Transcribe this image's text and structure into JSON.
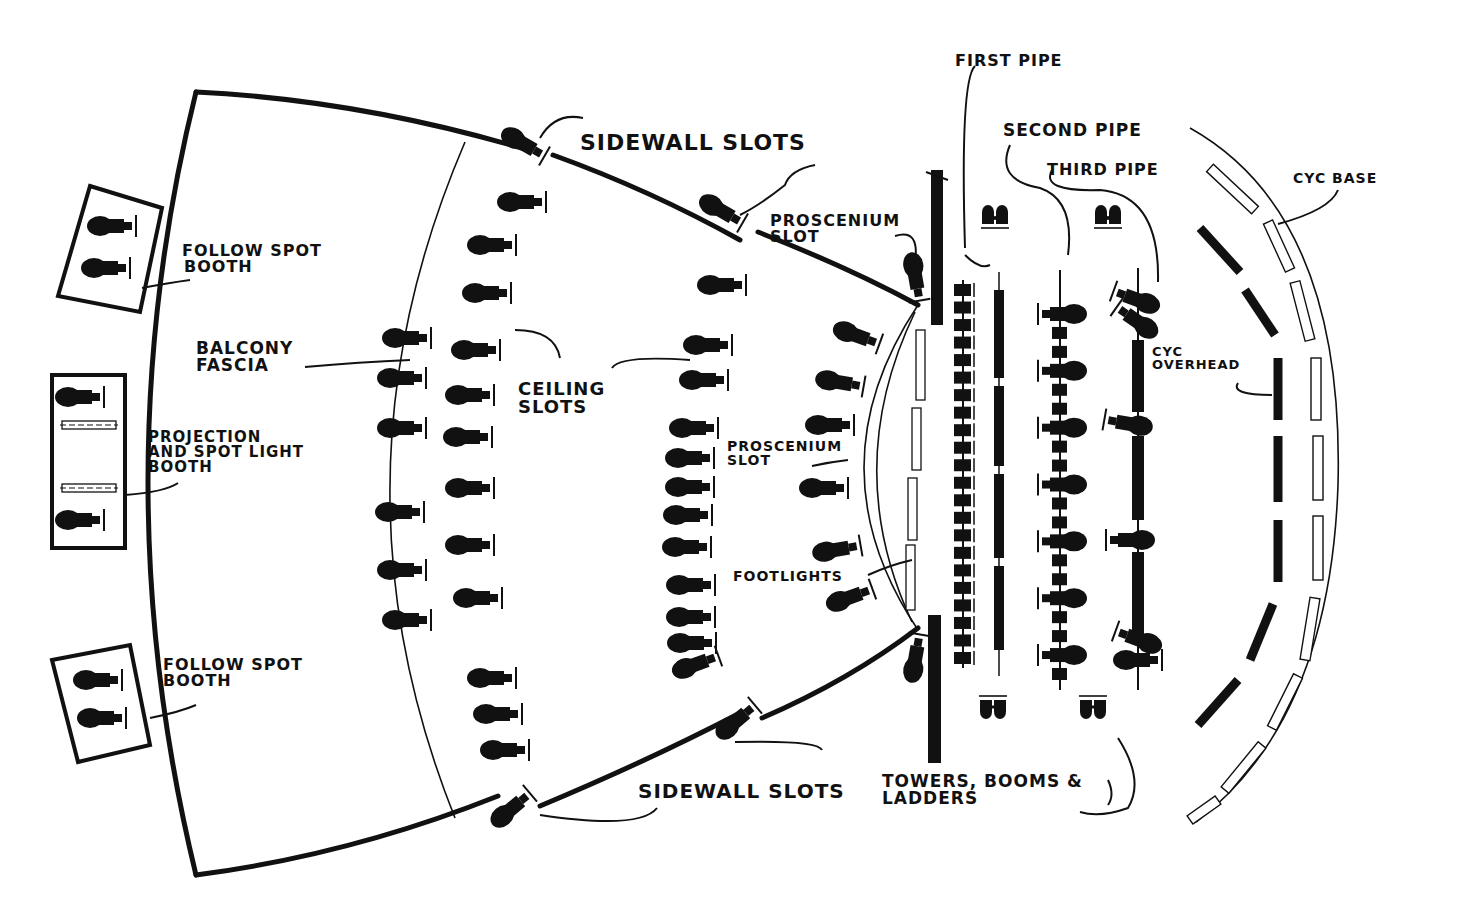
{
  "diagram": {
    "colors": {
      "ink": "#111111",
      "paper": "#ffffff"
    },
    "labels": [
      {
        "id": "first-pipe",
        "lines": [
          "FIRST PIPE"
        ],
        "x": 955,
        "y": 66,
        "size": 16
      },
      {
        "id": "second-pipe",
        "lines": [
          "SECOND PIPE"
        ],
        "x": 1003,
        "y": 136,
        "size": 17
      },
      {
        "id": "third-pipe",
        "lines": [
          "THIRD PIPE"
        ],
        "x": 1047,
        "y": 175,
        "size": 16
      },
      {
        "id": "cyc-base",
        "lines": [
          "CYC BASE"
        ],
        "x": 1293,
        "y": 183,
        "size": 14
      },
      {
        "id": "sidewall-slots-top",
        "lines": [
          "SIDEWALL SLOTS"
        ],
        "x": 580,
        "y": 150,
        "size": 22
      },
      {
        "id": "proscenium-slot-top",
        "lines": [
          "PROSCENIUM",
          "SLOT"
        ],
        "x": 770,
        "y": 226,
        "size": 16
      },
      {
        "id": "follow-spot-booth-top",
        "lines": [
          "FOLLOW SPOT",
          "BOOTH"
        ],
        "x": 182,
        "y": 256,
        "size": 16
      },
      {
        "id": "balcony-fascia",
        "lines": [
          "BALCONY",
          "FASCIA"
        ],
        "x": 196,
        "y": 354,
        "size": 17
      },
      {
        "id": "ceiling-slots",
        "lines": [
          "CEILING",
          "SLOTS"
        ],
        "x": 518,
        "y": 395,
        "size": 18
      },
      {
        "id": "cyc-overhead",
        "lines": [
          "CYC",
          "OVERHEAD"
        ],
        "x": 1152,
        "y": 356,
        "size": 13
      },
      {
        "id": "projection-booth",
        "lines": [
          "PROJECTION",
          "AND SPOT LIGHT",
          "BOOTH"
        ],
        "x": 148,
        "y": 442,
        "size": 15
      },
      {
        "id": "proscenium-slot-mid",
        "lines": [
          "PROSCENIUM",
          "SLOT"
        ],
        "x": 727,
        "y": 451,
        "size": 14
      },
      {
        "id": "footlights",
        "lines": [
          "FOOTLIGHTS"
        ],
        "x": 733,
        "y": 581,
        "size": 14
      },
      {
        "id": "follow-spot-booth-bottom",
        "lines": [
          "FOLLOW SPOT",
          "BOOTH"
        ],
        "x": 163,
        "y": 670,
        "size": 16
      },
      {
        "id": "sidewall-slots-bottom",
        "lines": [
          "SIDEWALL SLOTS"
        ],
        "x": 638,
        "y": 798,
        "size": 20
      },
      {
        "id": "towers-booms-ladders",
        "lines": [
          "TOWERS, BOOMS &",
          "LADDERS"
        ],
        "x": 882,
        "y": 787,
        "size": 17
      }
    ],
    "booths": [
      {
        "id": "follow-spot-booth-top",
        "points": "90,186 162,208 140,312 58,296",
        "fixtures": [
          [
            110,
            226,
            0
          ],
          [
            104,
            268,
            0
          ]
        ]
      },
      {
        "id": "projection-booth",
        "points": "52,375 125,375 125,548 52,548",
        "fixtures": [
          [
            78,
            397,
            0
          ],
          [
            78,
            520,
            0
          ]
        ]
      },
      {
        "id": "follow-spot-booth-bottom",
        "points": "52,660 130,645 150,745 78,762",
        "fixtures": [
          [
            96,
            680,
            0
          ],
          [
            100,
            718,
            0
          ]
        ]
      }
    ],
    "balcony_fixtures": [
      [
        405,
        338,
        0
      ],
      [
        400,
        378,
        0
      ],
      [
        400,
        428,
        0
      ],
      [
        398,
        512,
        0
      ],
      [
        400,
        570,
        0
      ],
      [
        405,
        620,
        0
      ]
    ],
    "ceiling_slot_fixtures": [
      [
        520,
        202,
        0
      ],
      [
        490,
        245,
        0
      ],
      [
        485,
        293,
        0
      ],
      [
        474,
        350,
        0
      ],
      [
        468,
        395,
        0
      ],
      [
        466,
        437,
        0
      ],
      [
        468,
        488,
        0
      ],
      [
        468,
        545,
        0
      ],
      [
        476,
        598,
        0
      ],
      [
        490,
        678,
        0
      ],
      [
        496,
        714,
        0
      ],
      [
        503,
        750,
        0
      ]
    ],
    "ceiling_slot_fixtures_2": [
      [
        720,
        285,
        0
      ],
      [
        706,
        345,
        0
      ],
      [
        702,
        380,
        0
      ],
      [
        692,
        428,
        0
      ],
      [
        688,
        458,
        0
      ],
      [
        688,
        487,
        0
      ],
      [
        686,
        515,
        0
      ],
      [
        685,
        547,
        0
      ],
      [
        689,
        585,
        0
      ],
      [
        689,
        617,
        0
      ],
      [
        690,
        643,
        0
      ],
      [
        694,
        665,
        -20
      ]
    ],
    "proscenium_fixtures": [
      [
        855,
        335,
        20
      ],
      [
        838,
        382,
        10
      ],
      [
        828,
        425,
        0
      ],
      [
        822,
        488,
        0
      ],
      [
        835,
        550,
        -10
      ],
      [
        848,
        598,
        -20
      ]
    ],
    "sidewall_slot_fixtures": [
      [
        522,
        143,
        30
      ],
      [
        720,
        210,
        30
      ],
      [
        510,
        810,
        -40
      ],
      [
        735,
        722,
        -40
      ]
    ],
    "pipes": {
      "first_pipe": {
        "x": 963,
        "y1": 280,
        "y2": 668,
        "units": 22
      },
      "second_pipe": {
        "x": 1060,
        "y1": 270,
        "y2": 690,
        "units": 20
      },
      "third_pipe": {
        "x": 1138,
        "y1": 268,
        "y2": 690,
        "units": 12
      }
    },
    "cyc_overhead_segments": [
      [
        1200,
        228,
        1240,
        272
      ],
      [
        1245,
        290,
        1275,
        335
      ],
      [
        1278,
        358,
        1278,
        420
      ],
      [
        1278,
        436,
        1278,
        502
      ],
      [
        1278,
        520,
        1278,
        582
      ],
      [
        1273,
        604,
        1250,
        660
      ],
      [
        1238,
        680,
        1198,
        725
      ]
    ],
    "towers": [
      {
        "x": 995,
        "y": 212,
        "flip": false
      },
      {
        "x": 1108,
        "y": 212,
        "flip": false
      },
      {
        "x": 993,
        "y": 712,
        "flip": true
      },
      {
        "x": 1093,
        "y": 712,
        "flip": true
      }
    ]
  }
}
